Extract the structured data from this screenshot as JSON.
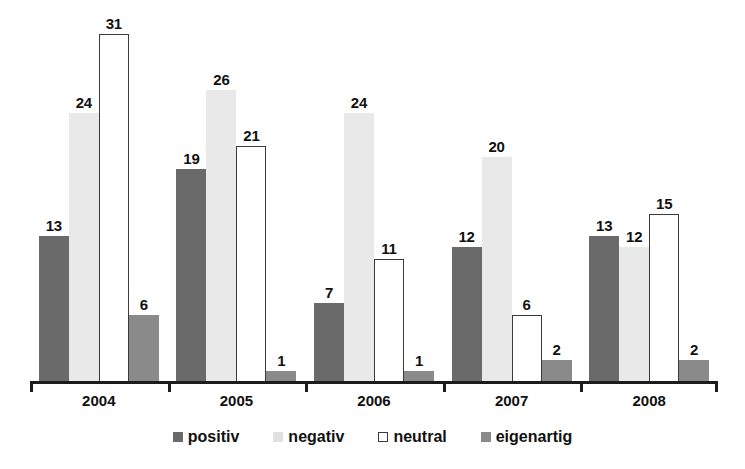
{
  "chart_data": {
    "type": "bar",
    "title": "",
    "subtitle": "",
    "xlabel": "",
    "ylabel": "",
    "categories": [
      "2004",
      "2005",
      "2006",
      "2007",
      "2008"
    ],
    "series": [
      {
        "name": "positiv",
        "color": "#6a6a6a",
        "values": [
          13,
          24,
          7,
          12,
          13
        ]
      },
      {
        "name": "negativ",
        "color": "#e9e9e9",
        "values": [
          24,
          26,
          24,
          20,
          12
        ]
      },
      {
        "name": "neutral",
        "color": "#ffffff",
        "values": [
          31,
          21,
          11,
          6,
          15
        ]
      },
      {
        "name": "eigenartig",
        "color": "#8a8a8a",
        "values": [
          6,
          1,
          1,
          2,
          2
        ]
      }
    ],
    "data_labels": true,
    "grid": false,
    "y_axis_visible": false,
    "ylim": [
      0,
      31
    ],
    "legend_position": "bottom",
    "legend_entries": [
      "positiv",
      "negativ",
      "neutral",
      "eigenartig"
    ],
    "groups": [
      {
        "category": "2004",
        "values": [
          13,
          24,
          31,
          6
        ]
      },
      {
        "category": "2005",
        "values": [
          19,
          26,
          21,
          1
        ]
      },
      {
        "category": "2006",
        "values": [
          7,
          24,
          11,
          1
        ]
      },
      {
        "category": "2007",
        "values": [
          12,
          20,
          6,
          2
        ]
      },
      {
        "category": "2008",
        "values": [
          13,
          12,
          15,
          2
        ]
      }
    ]
  }
}
